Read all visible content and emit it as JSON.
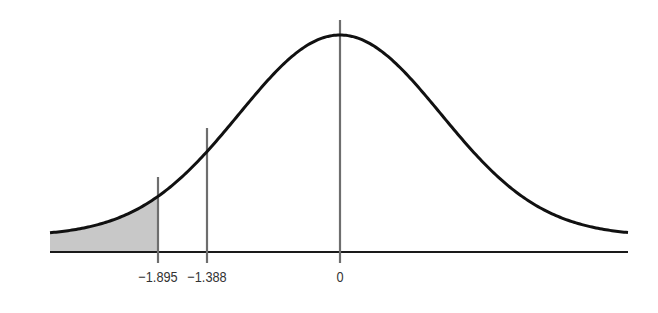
{
  "diagram": {
    "type": "normal-distribution-curve",
    "shaded_region": "left tail below -1.895",
    "colors": {
      "curve": "#111111",
      "axis": "#1a1a1a",
      "markers": "#6e6e6e",
      "shading": "#c8c8c8"
    },
    "markers": [
      {
        "value": -1.895,
        "label": "−1.895"
      },
      {
        "value": -1.388,
        "label": "−1.388"
      },
      {
        "value": 0,
        "label": "0"
      }
    ]
  }
}
